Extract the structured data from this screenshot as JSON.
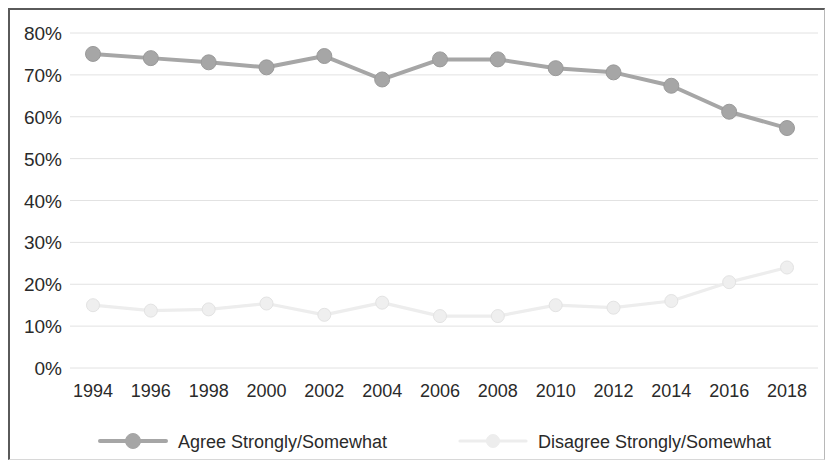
{
  "chart_data": {
    "type": "line",
    "title": "",
    "subtitle": "",
    "xlabel": "",
    "ylabel": "",
    "categories": [
      "1994",
      "1996",
      "1998",
      "2000",
      "2002",
      "2004",
      "2006",
      "2008",
      "2010",
      "2012",
      "2014",
      "2016",
      "2018"
    ],
    "ylim": [
      0,
      80
    ],
    "ytick_labels": [
      "80%",
      "70%",
      "60%",
      "50%",
      "40%",
      "30%",
      "20%",
      "10%",
      "0%"
    ],
    "ytick_values": [
      80,
      70,
      60,
      50,
      40,
      30,
      20,
      10,
      0
    ],
    "grid": true,
    "grid_axis": "y",
    "legend_position": "bottom",
    "series": [
      {
        "name": "Agree Strongly/Somewhat",
        "color": "#a6a6a6",
        "marker": "circle",
        "values": [
          75.0,
          74.0,
          73.0,
          71.8,
          74.5,
          68.9,
          73.7,
          73.7,
          71.6,
          70.6,
          67.4,
          61.2,
          57.3
        ]
      },
      {
        "name": "Disagree Strongly/Somewhat",
        "color": "#ededed",
        "marker": "circle",
        "values": [
          15.0,
          13.7,
          14.0,
          15.4,
          12.7,
          15.6,
          12.4,
          12.4,
          15.0,
          14.4,
          16.0,
          20.5,
          24.0
        ]
      }
    ]
  },
  "legend": {
    "items": [
      {
        "label": "Agree Strongly/Somewhat",
        "color": "#a6a6a6"
      },
      {
        "label": "Disagree Strongly/Somewhat",
        "color": "#ededed"
      }
    ]
  },
  "colors": {
    "agree": "#a6a6a6",
    "disagree": "#ededed",
    "gridline": "#e2e2e2",
    "axis_text": "#2a2a2a",
    "frame": "#5a5a5a",
    "background": "#ffffff"
  }
}
